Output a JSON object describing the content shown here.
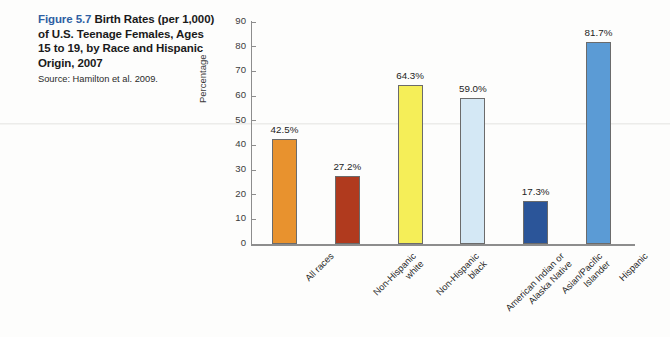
{
  "caption": {
    "figure_number": "Figure 5.7",
    "title": " Birth Rates (per 1,000) of U.S. Teenage Females, Ages 15 to 19, by Race and Hispanic Origin, 2007",
    "source": "Source: Hamilton et al. 2009.",
    "figure_number_color": "#2e5fa3"
  },
  "chart_data": {
    "type": "bar",
    "title": "Birth Rates (per 1,000) of U.S. Teenage Females, Ages 15 to 19, by Race and Hispanic Origin, 2007",
    "xlabel": "",
    "ylabel": "Percentage",
    "ylim": [
      0,
      90
    ],
    "yticks": [
      0,
      10,
      20,
      30,
      40,
      50,
      60,
      70,
      80,
      90
    ],
    "ytick_labels": [
      "0",
      "10",
      "20",
      "30",
      "40",
      "50",
      "60",
      "70",
      "80",
      "90"
    ],
    "grid": false,
    "legend": "none",
    "categories": [
      "All races",
      "Non-Hispanic white",
      "Non-Hispanic black",
      "American Indian or Alaska Native",
      "Asian/Pacific Islander",
      "Hispanic"
    ],
    "category_lines": [
      [
        "All races"
      ],
      [
        "Non-Hispanic",
        "white"
      ],
      [
        "Non-Hispanic",
        "black"
      ],
      [
        "American Indian or",
        "Alaska Native"
      ],
      [
        "Asian/Pacific",
        "Islander"
      ],
      [
        "Hispanic"
      ]
    ],
    "values": [
      42.5,
      27.2,
      64.3,
      59.0,
      17.3,
      81.7
    ],
    "data_labels": [
      "42.5%",
      "27.2%",
      "64.3%",
      "59.0%",
      "17.3%",
      "81.7%"
    ],
    "bar_colors": [
      "#e8922e",
      "#b03a1e",
      "#f5ee58",
      "#d4e8f5",
      "#2b5599",
      "#5b9bd5"
    ],
    "bar_edge_color": "#6b6b6b"
  }
}
